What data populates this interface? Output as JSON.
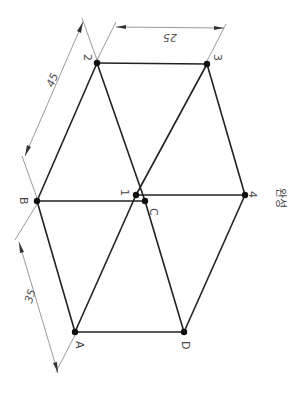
{
  "diagram": {
    "points": {
      "2": "2",
      "3": "3",
      "B": "B",
      "1": "1",
      "C": "C",
      "4": "4",
      "A": "A",
      "D": "D"
    },
    "dimensions": {
      "top": "25",
      "upper_left": "45",
      "lower_left": "35"
    },
    "caption": "완성"
  }
}
